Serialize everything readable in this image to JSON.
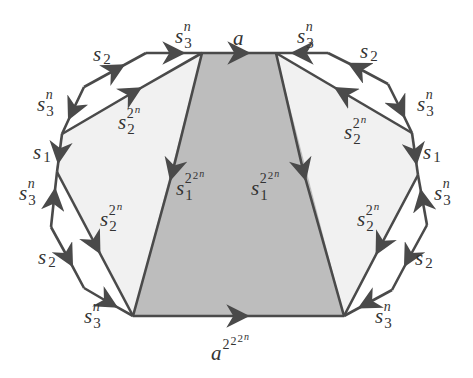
{
  "diagram": {
    "colors": {
      "edge": "#4a4a4a",
      "central_fill": "#bdbdbd",
      "side_fill": "#f1f1f1",
      "label": "#333333"
    },
    "vertices": {
      "A": [
        202,
        53
      ],
      "B": [
        276,
        53
      ],
      "C": [
        133,
        316
      ],
      "D": [
        344,
        316
      ],
      "L1": [
        146,
        53
      ],
      "L2": [
        84,
        87
      ],
      "L3": [
        62,
        134
      ],
      "L4": [
        57,
        172
      ],
      "L5": [
        51,
        227
      ],
      "L6": [
        84,
        288
      ],
      "R1": [
        328,
        53
      ],
      "R2": [
        388,
        84
      ],
      "R3": [
        412,
        133
      ],
      "R4": [
        418,
        175
      ],
      "R5": [
        427,
        225
      ],
      "R6": [
        392,
        290
      ]
    },
    "labels": {
      "top_a": {
        "base": "a",
        "sup": ""
      },
      "top_left_s3n": {
        "base": "s",
        "sub": "3",
        "sup": "n"
      },
      "top_right_s3n": {
        "base": "s",
        "sub": "3",
        "sup": "n"
      },
      "left_s2_top": {
        "base": "s",
        "sub": "2"
      },
      "right_s2_top": {
        "base": "s",
        "sub": "2"
      },
      "left_s3n_upper": {
        "base": "s",
        "sub": "3",
        "sup": "n"
      },
      "right_s3n_upper": {
        "base": "s",
        "sub": "3",
        "sup": "n"
      },
      "left_s22n_upper": {
        "base": "s",
        "sub": "2",
        "sup": "2",
        "supsup": "n"
      },
      "right_s22n_upper": {
        "base": "s",
        "sub": "2",
        "sup": "2",
        "supsup": "n"
      },
      "left_s1": {
        "base": "s",
        "sub": "1"
      },
      "right_s1": {
        "base": "s",
        "sub": "1"
      },
      "center_left_s1": {
        "base": "s",
        "sub": "1",
        "sup": "2",
        "supsup": "2",
        "supsupsup": "n"
      },
      "center_right_s1": {
        "base": "s",
        "sub": "1",
        "sup": "2",
        "supsup": "2",
        "supsupsup": "n"
      },
      "left_s3n_lower": {
        "base": "s",
        "sub": "3",
        "sup": "n"
      },
      "right_s3n_lower": {
        "base": "s",
        "sub": "3",
        "sup": "n"
      },
      "left_s22n_lower": {
        "base": "s",
        "sub": "2",
        "sup": "2",
        "supsup": "n"
      },
      "right_s22n_lower": {
        "base": "s",
        "sub": "2",
        "sup": "2",
        "supsup": "n"
      },
      "left_s2_bottom": {
        "base": "s",
        "sub": "2"
      },
      "right_s2_bottom": {
        "base": "s",
        "sub": "2"
      },
      "bottom_left_s3n": {
        "base": "s",
        "sub": "3",
        "sup": "n"
      },
      "bottom_right_s3n": {
        "base": "s",
        "sub": "3",
        "sup": "n"
      },
      "bottom_a": {
        "base": "a",
        "sup": "2",
        "supsup": "2",
        "supsupsup": "2",
        "supsupsupsup": "n"
      }
    },
    "text": {
      "s": "s",
      "a": "a",
      "n": "n",
      "one": "1",
      "two": "2",
      "three": "3"
    }
  }
}
